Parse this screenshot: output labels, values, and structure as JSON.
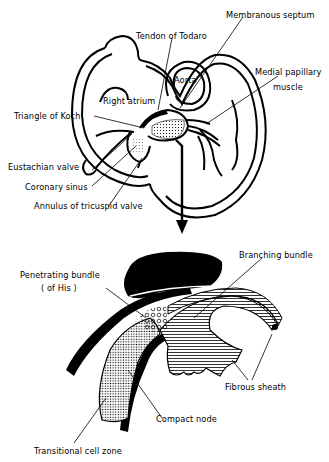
{
  "figure": {
    "top_panel": {
      "title": "Heart (right side) overview",
      "labels": {
        "membranous_septum": "Membranous septum",
        "tendon_of_todaro": "Tendon of Todaro",
        "aorta": "Aorta",
        "medial_papillary_muscle_line1": "Medial papillary",
        "medial_papillary_muscle_line2": "muscle",
        "right_atrium": "Right atrium",
        "triangle_of_koch": "Triangle of Koch",
        "eustachian_valve": "Eustachian valve",
        "coronary_sinus": "Coronary sinus",
        "annulus_of_tricuspid_valve": "Annulus of tricuspid valve"
      }
    },
    "bottom_panel": {
      "title": "Conduction tissue enlargement",
      "labels": {
        "penetrating_bundle_line1": "Penetrating bundle",
        "penetrating_bundle_line2": "( of His )",
        "branching_bundle": "Branching bundle",
        "fibrous_sheath": "Fibrous sheath",
        "compact_node": "Compact node",
        "transitional_cell_zone": "Transitional cell zone"
      }
    },
    "colors": {
      "ink": "#000000",
      "paper": "#ffffff"
    }
  }
}
